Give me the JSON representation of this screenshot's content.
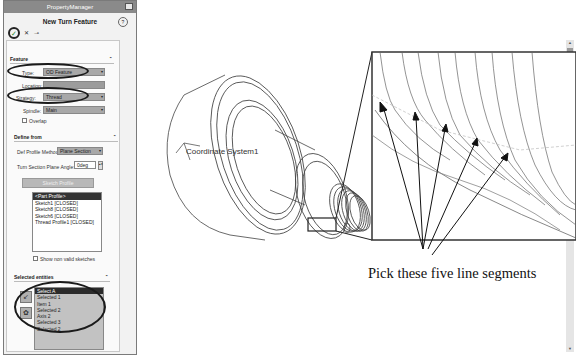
{
  "property_manager": {
    "title": "PropertyManager",
    "feature_title": "New Turn Feature",
    "ok_icon": "check-icon",
    "cancel_icon": "x-icon",
    "pin_icon": "pushpin-icon",
    "help_icon": "help-icon"
  },
  "feature_group": {
    "header": "Feature",
    "type_label": "Type:",
    "type_value": "OD Feature",
    "location_label": "Location:",
    "location_value": "",
    "strategy_label": "Strategy:",
    "strategy_value": "Thread",
    "spindle_label": "Spindle:",
    "spindle_value": "Main",
    "overlap_label": "Overlap"
  },
  "define_from_group": {
    "header": "Define from",
    "profile_method_label": "Def Profile Method:",
    "profile_method_value": "Plane Section",
    "angle_label": "Turn Section Plane Angle:",
    "angle_value": "0deg",
    "button_label": "Sketch Profile",
    "sketches": [
      {
        "label": "<Part Profile>",
        "selected": true
      },
      {
        "label": "Sketch1 [CLOSED]",
        "selected": false
      },
      {
        "label": "Sketch8 [CLOSED]",
        "selected": false
      },
      {
        "label": "Sketch6 [CLOSED]",
        "selected": false
      },
      {
        "label": "Thread Profile1 [CLOSED]",
        "selected": false
      }
    ],
    "show_non_valid_label": "Show non valid sketches"
  },
  "selected_entities_group": {
    "header": "Selected entities",
    "items": [
      {
        "label": "Select A",
        "selected": true
      },
      {
        "label": "Selected 1",
        "selected": false
      },
      {
        "label": "Item 1",
        "selected": false
      },
      {
        "label": "Selected 2",
        "selected": false
      },
      {
        "label": "Axis 2",
        "selected": false
      },
      {
        "label": "Selected 3",
        "selected": false
      },
      {
        "label": "Selected 2",
        "selected": false
      }
    ],
    "icons": [
      "edge-select-icon",
      "face-select-icon"
    ]
  },
  "viewport": {
    "coordinate_label": "Coordinate System1",
    "axis_labels": [
      "X",
      "Y",
      "Z"
    ]
  },
  "annotation": {
    "caption": "Pick these five line segments",
    "arrow_count": 5
  }
}
